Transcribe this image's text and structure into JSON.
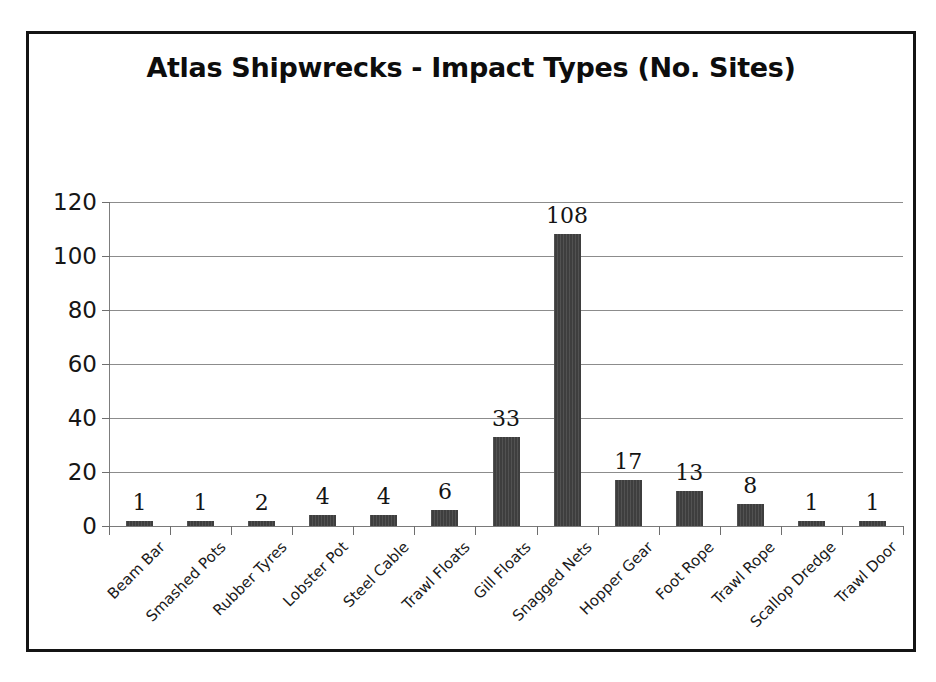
{
  "chart_data": {
    "type": "bar",
    "title": "Atlas Shipwrecks - Impact Types (No. Sites)",
    "xlabel": "",
    "ylabel": "",
    "categories": [
      "Beam Bar",
      "Smashed Pots",
      "Rubber Tyres",
      "Lobster Pot",
      "Steel Cable",
      "Trawl Floats",
      "Gill Floats",
      "Snagged Nets",
      "Hopper Gear",
      "Foot Rope",
      "Trawl Rope",
      "Scallop Dredge",
      "Trawl Door"
    ],
    "values": [
      1,
      1,
      2,
      4,
      4,
      6,
      33,
      108,
      17,
      13,
      8,
      1,
      1
    ],
    "data_labels": [
      "1",
      "1",
      "2",
      "4",
      "4",
      "6",
      "33",
      "108",
      "17",
      "13",
      "8",
      "1",
      "1"
    ],
    "ylim": [
      0,
      120
    ],
    "ytick_values": [
      0,
      20,
      40,
      60,
      80,
      100,
      120
    ],
    "ytick_labels": [
      "0",
      "20",
      "40",
      "60",
      "80",
      "100",
      "120"
    ],
    "grid": true,
    "legend": false,
    "legend_position": "none",
    "bar_color": "#3e3e3e",
    "gridline_color": "#8c8c8c",
    "text_color": "#141414",
    "background_color": "#ffffff",
    "frame_color": "#141414",
    "xtick_label_rotation": -45
  }
}
